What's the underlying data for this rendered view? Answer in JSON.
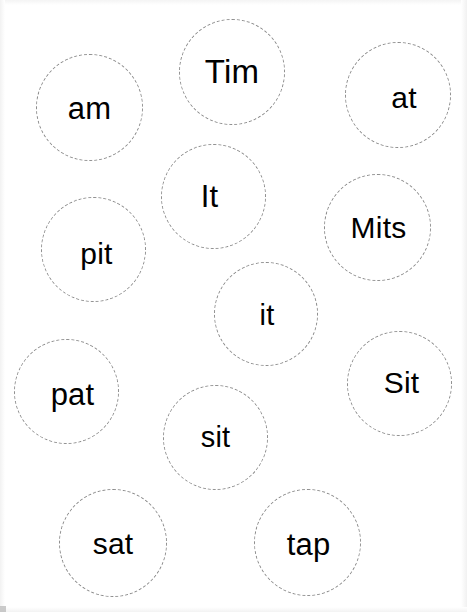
{
  "worksheet": {
    "title": "Word Circles Worksheet",
    "background_color": "#ffffff",
    "width": 467,
    "height": 612,
    "circle_border_color": "#8d8d8d",
    "circle_border_style": "dashed",
    "text_color": "#000000",
    "bubbles": [
      {
        "word": "am",
        "x": 36,
        "y": 54,
        "size": 107,
        "font_size": 31,
        "border_width": 1.4,
        "text_dx": 0,
        "text_dy": 1
      },
      {
        "word": "Tim",
        "x": 179,
        "y": 19,
        "size": 106,
        "font_size": 33,
        "border_width": 1.4,
        "text_dx": 0,
        "text_dy": -1
      },
      {
        "word": "at",
        "x": 345,
        "y": 42,
        "size": 106,
        "font_size": 30,
        "border_width": 1.4,
        "text_dx": 6,
        "text_dy": 3
      },
      {
        "word": "It",
        "x": 161,
        "y": 144,
        "size": 105,
        "font_size": 31,
        "border_width": 1.4,
        "text_dx": -4,
        "text_dy": 0
      },
      {
        "word": "pit",
        "x": 41,
        "y": 197,
        "size": 105,
        "font_size": 30,
        "border_width": 1.4,
        "text_dx": 3,
        "text_dy": 4
      },
      {
        "word": "Mits",
        "x": 324,
        "y": 174,
        "size": 107,
        "font_size": 30,
        "border_width": 1.4,
        "text_dx": 1,
        "text_dy": 0
      },
      {
        "word": "it",
        "x": 214,
        "y": 262,
        "size": 104,
        "font_size": 29,
        "border_width": 1.4,
        "text_dx": 1,
        "text_dy": 1
      },
      {
        "word": "pat",
        "x": 14,
        "y": 339,
        "size": 105,
        "font_size": 31,
        "border_width": 1.4,
        "text_dx": 6,
        "text_dy": 3
      },
      {
        "word": "Sit",
        "x": 347,
        "y": 331,
        "size": 105,
        "font_size": 30,
        "border_width": 1.4,
        "text_dx": 2,
        "text_dy": -1
      },
      {
        "word": "sit",
        "x": 163,
        "y": 385,
        "size": 105,
        "font_size": 29,
        "border_width": 1.4,
        "text_dx": 0,
        "text_dy": 0
      },
      {
        "word": "sat",
        "x": 59,
        "y": 489,
        "size": 108,
        "font_size": 30,
        "border_width": 1.4,
        "text_dx": 0,
        "text_dy": 1
      },
      {
        "word": "tap",
        "x": 254,
        "y": 489,
        "size": 107,
        "font_size": 31,
        "border_width": 1.4,
        "text_dx": 1,
        "text_dy": 2
      }
    ]
  }
}
